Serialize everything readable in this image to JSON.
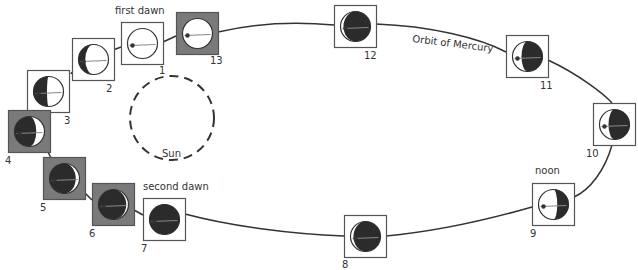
{
  "title_labels": {
    "first_dawn": "first dawn",
    "second_dawn": "second dawn",
    "noon": "noon",
    "orbit": "Orbit of Mercury",
    "sun": "Sun"
  },
  "colors": {
    "gray_box": "#7a7a7a",
    "dark_side": "#2b2b2b",
    "line": "#333333",
    "box_border": "#555555"
  },
  "positions": [
    {
      "number": "1",
      "box": "white",
      "phase": "lit",
      "note": "first dawn"
    },
    {
      "number": "2",
      "box": "white",
      "phase": "left-crescent-dark"
    },
    {
      "number": "3",
      "box": "white",
      "phase": "left-half-dark"
    },
    {
      "number": "4",
      "box": "gray",
      "phase": "right-crescent-lit"
    },
    {
      "number": "5",
      "box": "gray",
      "phase": "thin-right-lit"
    },
    {
      "number": "6",
      "box": "gray",
      "phase": "thinner-right-lit"
    },
    {
      "number": "7",
      "box": "white",
      "phase": "dark",
      "note": "second dawn"
    },
    {
      "number": "8",
      "box": "white",
      "phase": "dark-left-sliver"
    },
    {
      "number": "9",
      "box": "white",
      "phase": "right-dark",
      "note": "noon"
    },
    {
      "number": "10",
      "box": "white",
      "phase": "right-crescent-dark"
    },
    {
      "number": "11",
      "box": "white",
      "phase": "right-crescent-dark"
    },
    {
      "number": "12",
      "box": "white",
      "phase": "thin-right-dark"
    },
    {
      "number": "13",
      "box": "gray",
      "phase": "lit"
    }
  ]
}
